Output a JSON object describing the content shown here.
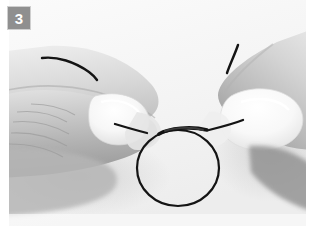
{
  "figure": {
    "kind": "instructional-photograph",
    "width": 314,
    "height": 237,
    "background_color": "#ffffff"
  },
  "step_badge": {
    "number": "3",
    "background_color": "#8f8f8f",
    "text_color": "#ffffff",
    "border_color": "#cfcfcf"
  },
  "photo": {
    "left": 9,
    "top": 0,
    "width": 297,
    "height": 226,
    "backdrop_color": "#f6f6f6",
    "backdrop_shadow_color": "#e6e6e6"
  },
  "cord": {
    "color": "#141414",
    "highlight_color": "#3a3a3a",
    "stroke_width": 2.2,
    "loop": {
      "center_x": 169,
      "center_y": 168,
      "radius_x": 41,
      "radius_y": 38
    },
    "knot_x": 178,
    "knot_y": 131,
    "left_tail_label": "loose end over left index finger",
    "right_tail_label": "loose end above right thumb"
  },
  "hands": {
    "left": {
      "label": "left-hand",
      "skin_light": "#f1f1f1",
      "skin_mid": "#c9c9c9",
      "skin_dark": "#9d9d9d",
      "nail_color": "#fbfbfb"
    },
    "right": {
      "label": "right-hand",
      "skin_light": "#f4f4f4",
      "skin_mid": "#d2d2d2",
      "skin_dark": "#a6a6a6",
      "nail_color": "#fcfcfc"
    }
  }
}
